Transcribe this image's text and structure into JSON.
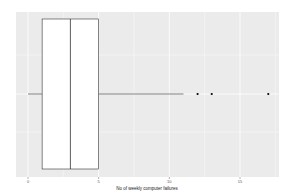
{
  "chart_data": {
    "type": "boxplot",
    "orientation": "horizontal",
    "title": "",
    "xlabel": "No of weekly computer failures",
    "ylabel": "",
    "xlim": [
      -0.1,
      17.6
    ],
    "xticks": [
      0,
      5,
      10,
      15
    ],
    "xtick_labels": [
      "0",
      "5",
      "10",
      "15"
    ],
    "grid": true,
    "legend": null,
    "box": {
      "whisker_low": 0,
      "q1": 1,
      "median": 3,
      "q3": 5,
      "whisker_high": 11,
      "outliers": [
        12,
        13,
        17
      ]
    },
    "colors": {
      "panel_bg": "#ebebeb",
      "grid": "#ffffff",
      "box_fill": "#ffffff",
      "box_line": "#333333",
      "outlier": "#000000"
    }
  }
}
